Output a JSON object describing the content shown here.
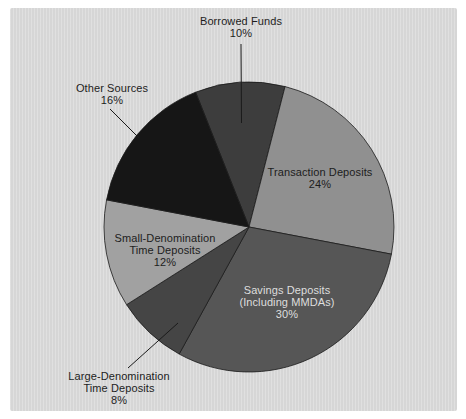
{
  "figure": {
    "page_background": "#ffffff",
    "panel_background": "#d9d9d9",
    "outline_color": "#1c1c1c",
    "label_text_color": "#1d1d1d"
  },
  "chart_data": {
    "type": "pie",
    "title": "",
    "start_angle_deg": -21.6,
    "direction": "clockwise",
    "legend": "none",
    "slices": [
      {
        "id": "borrowed-funds",
        "label": "Borrowed Funds",
        "pct": 10,
        "value_text": "10%",
        "color": "#3d3d3d",
        "label_position": "outside",
        "lines": [
          "Borrowed Funds",
          "10%"
        ]
      },
      {
        "id": "transaction-deposits",
        "label": "Transaction Deposits",
        "pct": 24,
        "value_text": "24%",
        "color": "#909090",
        "label_position": "inside",
        "lines": [
          "Transaction Deposits",
          "24%"
        ]
      },
      {
        "id": "savings-deposits",
        "label": "Savings Deposits (Including MMDAs)",
        "pct": 30,
        "value_text": "30%",
        "color": "#565656",
        "label_position": "inside",
        "label_color": "#dedede",
        "lines": [
          "Savings Deposits",
          "(Including MMDAs)",
          "30%"
        ]
      },
      {
        "id": "large-denomination-time-deposits",
        "label": "Large-Denomination Time Deposits",
        "pct": 8,
        "value_text": "8%",
        "color": "#454545",
        "label_position": "outside",
        "lines": [
          "Large-Denomination",
          "Time Deposits",
          "8%"
        ]
      },
      {
        "id": "small-denomination-time-deposits",
        "label": "Small-Denomination Time Deposits",
        "pct": 12,
        "value_text": "12%",
        "color": "#a1a1a1",
        "label_position": "inside",
        "lines": [
          "Small-Denomination",
          "Time Deposits",
          "12%"
        ]
      },
      {
        "id": "other-sources",
        "label": "Other Sources",
        "pct": 16,
        "value_text": "16%",
        "color": "#161616",
        "label_position": "outside",
        "lines": [
          "Other Sources",
          "16%"
        ]
      }
    ]
  }
}
